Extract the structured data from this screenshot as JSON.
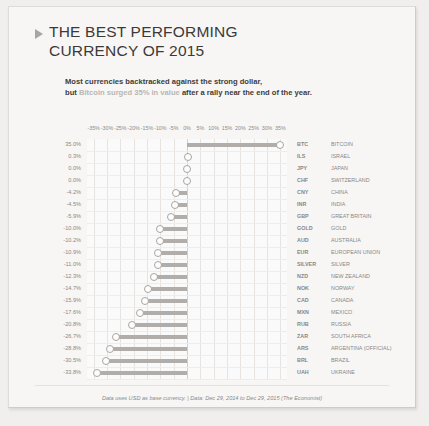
{
  "header": {
    "title_line1": "THE BEST PERFORMING",
    "title_line2": "CURRENCY OF 2015",
    "arrow_icon": "triangle-right-icon",
    "subtitle_line1": "Most currencies backtracked against the strong dollar,",
    "subtitle_prefix": "but ",
    "subtitle_highlight": "Bitcoin surged 35% in value",
    "subtitle_suffix": " after a rally near the end of the year."
  },
  "footer": {
    "source": "Data uses USD as base currency. | Data: Dec 29, 2014 to Dec 29, 2015 (The Economist)"
  },
  "colors": {
    "background": "#f0efee",
    "card": "#f7f6f5",
    "bar": "#b0adaa",
    "dot_stroke": "#a9a6a3",
    "text": "#3c3a38",
    "muted_text": "#8a8784",
    "highlight_text": "#b9b6b3",
    "grid": "#e6e3e0"
  },
  "chart_data": {
    "type": "bar",
    "subtitle": "Most currencies backtracked against the strong dollar, but Bitcoin surged 35% in value after a rally near the end of the year.",
    "xlabel": "",
    "ylabel": "",
    "xlim": [
      -37.5,
      37.5
    ],
    "xticks": [
      "-35%",
      "-30%",
      "-25%",
      "-20%",
      "-15%",
      "-10%",
      "-5%",
      "0%",
      "5%",
      "10%",
      "15%",
      "20%",
      "25%",
      "30%",
      "35%"
    ],
    "xtick_values": [
      -35,
      -30,
      -25,
      -20,
      -15,
      -10,
      -5,
      0,
      5,
      10,
      15,
      20,
      25,
      30,
      35
    ],
    "grid": true,
    "legend": "none",
    "orientation": "horizontal",
    "value_suffix": "%",
    "categories": [
      "BTC",
      "ILS",
      "JPY",
      "CHF",
      "CNY",
      "INR",
      "GBP",
      "GOLD",
      "AUD",
      "EUR",
      "SILVER",
      "NZD",
      "NOK",
      "CAD",
      "MXN",
      "RUB",
      "ZAR",
      "ARS",
      "BRL",
      "UAH"
    ],
    "values": [
      35.0,
      0.3,
      0.0,
      0.0,
      -4.2,
      -4.5,
      -5.9,
      -10.0,
      -10.2,
      -10.9,
      -11.0,
      -12.3,
      -14.7,
      -15.9,
      -17.6,
      -20.8,
      -26.7,
      -28.8,
      -30.5,
      -33.8
    ],
    "value_labels": [
      "35.0%",
      "0.3%",
      "0.0%",
      "0.0%",
      "-4.2%",
      "-4.5%",
      "-5.9%",
      "-10.0%",
      "-10.2%",
      "-10.9%",
      "-11.0%",
      "-12.3%",
      "-14.7%",
      "-15.9%",
      "-17.6%",
      "-20.8%",
      "-26.7%",
      "-28.8%",
      "-30.5%",
      "-33.8%"
    ],
    "country_labels": [
      "BITCOIN",
      "ISRAEL",
      "JAPAN",
      "SWITZERLAND",
      "CHINA",
      "INDIA",
      "GREAT BRITAIN",
      "GOLD",
      "AUSTRALIA",
      "EUROPEAN UNION",
      "SILVER",
      "NEW ZEALAND",
      "NORWAY",
      "CANADA",
      "MEXICO",
      "RUSSIA",
      "SOUTH AFRICA",
      "ARGENTINA (OFFICIAL)",
      "BRAZIL",
      "UKRAINE"
    ]
  }
}
